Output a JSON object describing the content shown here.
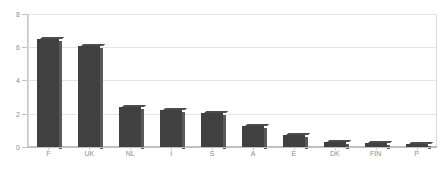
{
  "chart_data": {
    "type": "bar",
    "title": "",
    "subtitle": "",
    "xlabel": "",
    "ylabel": "",
    "categories": [
      "F",
      "UK",
      "NL",
      "I",
      "S",
      "A",
      "E",
      "DK",
      "FIN",
      "P"
    ],
    "values": [
      6.5,
      6.1,
      2.4,
      2.2,
      2.05,
      1.25,
      0.75,
      0.3,
      0.25,
      0.2
    ],
    "ylim": [
      0,
      8
    ],
    "ytick_values": [
      0,
      2,
      4,
      6,
      8
    ],
    "ytick_labels": [
      "0",
      "2",
      "4",
      "6",
      "8"
    ],
    "grid": true,
    "grid_axis": "y",
    "legend": false,
    "legend_position": "none",
    "annotations": [],
    "series": [
      {
        "name": "",
        "values": [
          6.5,
          6.1,
          2.4,
          2.2,
          2.05,
          1.25,
          0.75,
          0.3,
          0.25,
          0.2
        ]
      }
    ]
  },
  "style": {
    "bar_color": "#404040",
    "bar_side_color": "#595959",
    "bar_top_color": "#4d4d4d",
    "grid_color": "#e4e4e4",
    "axis_color": "#c0c0c0",
    "border_color": "#d9d9d9",
    "tick_label_color": "#8d8d8d",
    "background": "#ffffff"
  }
}
